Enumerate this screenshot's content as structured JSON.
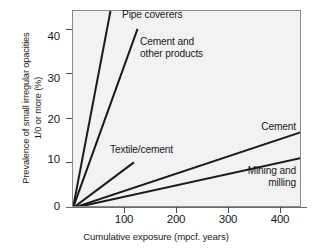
{
  "chart_data": {
    "type": "line",
    "title": "",
    "xlabel": "Cumulative exposure (mpcf. years)",
    "ylabel_line1": "Prevalence of small irregular opacities",
    "ylabel_line2": "1/0 or more (%)",
    "xlim": [
      0,
      440
    ],
    "ylim": [
      0,
      44
    ],
    "xticks": [
      100,
      200,
      300,
      400
    ],
    "xticklabels": [
      "100",
      "200",
      "300",
      "400"
    ],
    "yticks": [
      0,
      10,
      20,
      30,
      40
    ],
    "yticklabels": [
      "0",
      "10",
      "20",
      "30",
      "40"
    ],
    "grid": false,
    "legend": "inline-annotations",
    "series": [
      {
        "name": "Pipe coverers",
        "label": "Pipe coverers",
        "x": [
          0,
          72
        ],
        "y": [
          0,
          44
        ],
        "slope_pct_per_mpcf_year": 0.611
      },
      {
        "name": "Cement and other products",
        "label_line1": "Cement and",
        "label_line2": "other products",
        "x": [
          0,
          124
        ],
        "y": [
          0,
          40
        ],
        "slope_pct_per_mpcf_year": 0.323
      },
      {
        "name": "Textile/cement",
        "label": "Textile/cement",
        "x": [
          0,
          117
        ],
        "y": [
          0,
          10.2
        ],
        "slope_pct_per_mpcf_year": 0.087
      },
      {
        "name": "Cement",
        "label": "Cement",
        "x": [
          0,
          440
        ],
        "y": [
          0,
          17.0
        ],
        "slope_pct_per_mpcf_year": 0.0386
      },
      {
        "name": "Mining and milling",
        "label_line1": "Mining and",
        "label_line2": "milling",
        "x": [
          0,
          440
        ],
        "y": [
          0,
          11.2
        ],
        "slope_pct_per_mpcf_year": 0.0255
      }
    ],
    "colors": {
      "line": "#1a1a1a",
      "plot_background": "#f2f2f2",
      "frame": "#8a8a8a",
      "text": "#1a1a1a"
    }
  }
}
